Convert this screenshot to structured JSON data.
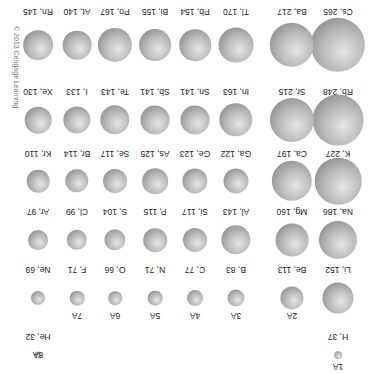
{
  "figure": {
    "copyright": "© 2013 Cengage Learning",
    "orientation": "rotated 180°",
    "groups": [
      "1A",
      "2A",
      "3A",
      "4A",
      "5A",
      "6A",
      "7A",
      "8A"
    ],
    "elements": [
      {
        "label": "H, 37",
        "symbol": "H",
        "radius": 37,
        "group": "1A",
        "period": 1
      },
      {
        "label": "He, 32",
        "symbol": "He",
        "radius": 32,
        "group": "8A",
        "period": 1
      },
      {
        "label": "Li, 152",
        "symbol": "Li",
        "radius": 152,
        "group": "1A",
        "period": 2
      },
      {
        "label": "Be, 113",
        "symbol": "Be",
        "radius": 113,
        "group": "2A",
        "period": 2
      },
      {
        "label": "B, 83",
        "symbol": "B",
        "radius": 83,
        "group": "3A",
        "period": 2
      },
      {
        "label": "C, 77",
        "symbol": "C",
        "radius": 77,
        "group": "4A",
        "period": 2
      },
      {
        "label": "N, 71",
        "symbol": "N",
        "radius": 71,
        "group": "5A",
        "period": 2
      },
      {
        "label": "O, 66",
        "symbol": "O",
        "radius": 66,
        "group": "6A",
        "period": 2
      },
      {
        "label": "F, 71",
        "symbol": "F",
        "radius": 71,
        "group": "7A",
        "period": 2
      },
      {
        "label": "Ne, 69",
        "symbol": "Ne",
        "radius": 69,
        "group": "8A",
        "period": 2
      },
      {
        "label": "Na, 186",
        "symbol": "Na",
        "radius": 186,
        "group": "1A",
        "period": 3
      },
      {
        "label": "Mg, 160",
        "symbol": "Mg",
        "radius": 160,
        "group": "2A",
        "period": 3
      },
      {
        "label": "Al, 143",
        "symbol": "Al",
        "radius": 143,
        "group": "3A",
        "period": 3
      },
      {
        "label": "Si, 117",
        "symbol": "Si",
        "radius": 117,
        "group": "4A",
        "period": 3
      },
      {
        "label": "P, 115",
        "symbol": "P",
        "radius": 115,
        "group": "5A",
        "period": 3
      },
      {
        "label": "S, 104",
        "symbol": "S",
        "radius": 104,
        "group": "6A",
        "period": 3
      },
      {
        "label": "Cl, 99",
        "symbol": "Cl",
        "radius": 99,
        "group": "7A",
        "period": 3
      },
      {
        "label": "Ar, 97",
        "symbol": "Ar",
        "radius": 97,
        "group": "8A",
        "period": 3
      },
      {
        "label": "K, 227",
        "symbol": "K",
        "radius": 227,
        "group": "1A",
        "period": 4
      },
      {
        "label": "Ca, 197",
        "symbol": "Ca",
        "radius": 197,
        "group": "2A",
        "period": 4
      },
      {
        "label": "Ga, 122",
        "symbol": "Ga",
        "radius": 122,
        "group": "3A",
        "period": 4
      },
      {
        "label": "Ge, 123",
        "symbol": "Ge",
        "radius": 123,
        "group": "4A",
        "period": 4
      },
      {
        "label": "As, 125",
        "symbol": "As",
        "radius": 125,
        "group": "5A",
        "period": 4
      },
      {
        "label": "Se, 117",
        "symbol": "Se",
        "radius": 117,
        "group": "6A",
        "period": 4
      },
      {
        "label": "Br, 114",
        "symbol": "Br",
        "radius": 114,
        "group": "7A",
        "period": 4
      },
      {
        "label": "Kr, 110",
        "symbol": "Kr",
        "radius": 110,
        "group": "8A",
        "period": 4
      },
      {
        "label": "Rb, 248",
        "symbol": "Rb",
        "radius": 248,
        "group": "1A",
        "period": 5
      },
      {
        "label": "Sr, 215",
        "symbol": "Sr",
        "radius": 215,
        "group": "2A",
        "period": 5
      },
      {
        "label": "In, 163",
        "symbol": "In",
        "radius": 163,
        "group": "3A",
        "period": 5
      },
      {
        "label": "Sn, 141",
        "symbol": "Sn",
        "radius": 141,
        "group": "4A",
        "period": 5
      },
      {
        "label": "Sb, 141",
        "symbol": "Sb",
        "radius": 141,
        "group": "5A",
        "period": 5
      },
      {
        "label": "Te, 143",
        "symbol": "Te",
        "radius": 143,
        "group": "6A",
        "period": 5
      },
      {
        "label": "I, 133",
        "symbol": "I",
        "radius": 133,
        "group": "7A",
        "period": 5
      },
      {
        "label": "Xe, 130",
        "symbol": "Xe",
        "radius": 130,
        "group": "8A",
        "period": 5
      },
      {
        "label": "Cs, 265",
        "symbol": "Cs",
        "radius": 265,
        "group": "1A",
        "period": 6
      },
      {
        "label": "Ba, 217",
        "symbol": "Ba",
        "radius": 217,
        "group": "2A",
        "period": 6
      },
      {
        "label": "Tl, 170",
        "symbol": "Tl",
        "radius": 170,
        "group": "3A",
        "period": 6
      },
      {
        "label": "Pb, 154",
        "symbol": "Pb",
        "radius": 154,
        "group": "4A",
        "period": 6
      },
      {
        "label": "Bi, 155",
        "symbol": "Bi",
        "radius": 155,
        "group": "5A",
        "period": 6
      },
      {
        "label": "Po, 167",
        "symbol": "Po",
        "radius": 167,
        "group": "6A",
        "period": 6
      },
      {
        "label": "At, 140",
        "symbol": "At",
        "radius": 140,
        "group": "7A",
        "period": 6
      },
      {
        "label": "Rn, 145",
        "symbol": "Rn",
        "radius": 145,
        "group": "8A",
        "period": 6
      }
    ]
  }
}
